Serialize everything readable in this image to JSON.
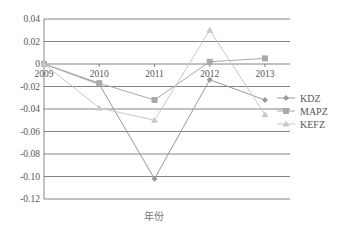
{
  "chart_data": {
    "type": "line",
    "title": "",
    "xlabel": "年份",
    "ylabel": "",
    "x": [
      "2009",
      "2010",
      "2011",
      "2012",
      "2013"
    ],
    "ylim": [
      -0.12,
      0.04
    ],
    "yticks": [
      "0.04",
      "0.02",
      "0",
      "-0.02",
      "-0.04",
      "-0.06",
      "-0.08",
      "-0.10",
      "-0.12"
    ],
    "ytick_values": [
      0.04,
      0.02,
      0,
      -0.02,
      -0.04,
      -0.06,
      -0.08,
      -0.1,
      -0.12
    ],
    "grid": true,
    "legend_position": "right",
    "series": [
      {
        "name": "KDZ",
        "marker": "diamond",
        "color": "#999999",
        "values": [
          0,
          -0.018,
          -0.102,
          -0.014,
          -0.032
        ]
      },
      {
        "name": "MAPZ",
        "marker": "square",
        "color": "#aaaaaa",
        "values": [
          0,
          -0.017,
          -0.032,
          0.002,
          0.005
        ]
      },
      {
        "name": "KEFZ",
        "marker": "triangle",
        "color": "#c8c8c8",
        "values": [
          0,
          -0.039,
          -0.05,
          0.03,
          -0.045
        ]
      }
    ]
  }
}
